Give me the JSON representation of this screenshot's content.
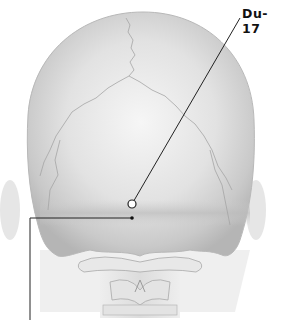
{
  "diagram": {
    "points": [
      {
        "id": "du-17",
        "label": "Du-17",
        "marker": "open-circle"
      },
      {
        "id": "unlabeled-point",
        "label": "",
        "marker": "small-dot"
      }
    ],
    "colors": {
      "background": "#ffffff",
      "bone_light": "#f2f2f2",
      "bone_mid": "#cfcfcf",
      "bone_dark": "#9a9a9a",
      "leader_line": "#222222",
      "label_text": "#111111"
    }
  }
}
